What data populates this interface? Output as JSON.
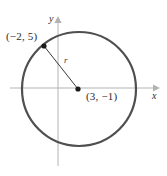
{
  "figure": {
    "type": "circle-on-coordinate-plane",
    "width": 167,
    "height": 176,
    "background_color": "#ffffff"
  },
  "axes": {
    "x": {
      "label": "x",
      "color": "#b0b0b0",
      "y_pixel": 88,
      "arrow": "right"
    },
    "y": {
      "label": "y",
      "color": "#b0b0b0",
      "x_pixel": 58,
      "arrow": "up"
    }
  },
  "circle": {
    "color": "#4f4f4f",
    "stroke_width": 2.2,
    "center_pixel": {
      "x": 79,
      "y": 89
    },
    "radius_pixel": 57
  },
  "points": [
    {
      "name": "point-on-circle",
      "label": "(−2, 5)",
      "x": -2,
      "y": 5,
      "pixel": {
        "x": 44,
        "y": 46
      }
    },
    {
      "name": "center-point",
      "label": "(3, −1)",
      "x": 3,
      "y": -1,
      "pixel": {
        "x": 78,
        "y": 89
      }
    }
  ],
  "radius_segment": {
    "label": "r",
    "color": "#3a3a3a",
    "from_pixel": {
      "x": 44,
      "y": 46
    },
    "to_pixel": {
      "x": 78,
      "y": 89
    }
  }
}
